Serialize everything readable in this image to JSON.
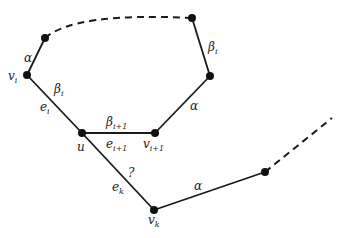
{
  "diagram": {
    "nodes": [
      {
        "id": "v_i",
        "label": "v",
        "sub": "i",
        "x": 27,
        "y": 75
      },
      {
        "id": "n_top_left",
        "x": 45,
        "y": 38
      },
      {
        "id": "n_top_right",
        "x": 192,
        "y": 18
      },
      {
        "id": "n_right",
        "x": 210,
        "y": 76
      },
      {
        "id": "u",
        "label": "u",
        "x": 82,
        "y": 133
      },
      {
        "id": "v_i1",
        "label": "v",
        "sub": "i+1",
        "x": 155,
        "y": 133
      },
      {
        "id": "v_k",
        "label": "v",
        "sub": "k",
        "x": 154,
        "y": 210
      },
      {
        "id": "n_lower_right",
        "x": 265,
        "y": 172
      }
    ],
    "labels": {
      "alpha_left": "α",
      "beta_i_left": "β",
      "beta_i_left_sub": "i",
      "e_i": "e",
      "e_i_sub": "i",
      "beta_i_right": "β",
      "beta_i_right_sub": "i",
      "alpha_right": "α",
      "beta_i1": "β",
      "beta_i1_sub": "i+1",
      "e_i1": "e",
      "e_i1_sub": "i+1",
      "u": "u",
      "v_i": "v",
      "v_i_sub": "i",
      "v_i1": "v",
      "v_i1_sub": "i+1",
      "question": "?",
      "e_k": "e",
      "e_k_sub": "k",
      "v_k": "v",
      "v_k_sub": "k",
      "alpha_bottom": "α"
    },
    "colors": {
      "stroke": "#1a1a1a",
      "node": "#111111"
    }
  }
}
